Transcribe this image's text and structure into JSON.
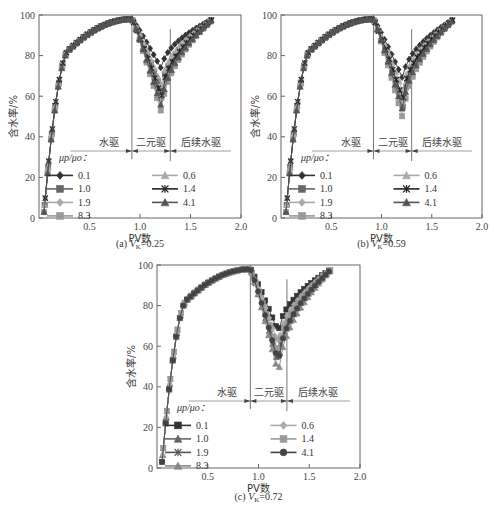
{
  "chart_data": [
    {
      "id": "a",
      "type": "line",
      "caption": "(a) V",
      "caption_sub": "K",
      "caption_val": "=0.25",
      "xlabel": "PV数",
      "ylabel": "含水率/%",
      "xlim": [
        0,
        2.0
      ],
      "ylim": [
        0,
        100
      ],
      "xticks": [
        "0.5",
        "1.0",
        "1.5",
        "2.0"
      ],
      "yticks": [
        "0",
        "20",
        "40",
        "60",
        "80",
        "100"
      ],
      "regions": [
        {
          "label": "水驱"
        },
        {
          "label": "二元驱"
        },
        {
          "label": "后续水驱"
        }
      ],
      "boundaries": [
        0.92,
        1.3
      ],
      "legend_title": "μp/μo：",
      "series": [
        {
          "name": "0.1",
          "marker": "diamond",
          "color": "#333333",
          "min": 73
        },
        {
          "name": "1.0",
          "marker": "square",
          "color": "#666666",
          "min": 62
        },
        {
          "name": "1.9",
          "marker": "diamond",
          "color": "#aaaaaa",
          "min": 57
        },
        {
          "name": "8.3",
          "marker": "square",
          "color": "#999999",
          "min": 51
        },
        {
          "name": "0.6",
          "marker": "triangle",
          "color": "#aaaaaa",
          "min": 65
        },
        {
          "name": "1.4",
          "marker": "star",
          "color": "#222222",
          "min": 59
        },
        {
          "name": "4.1",
          "marker": "triangle",
          "color": "#555555",
          "min": 54
        }
      ]
    },
    {
      "id": "b",
      "type": "line",
      "caption": "(b) V",
      "caption_sub": "K",
      "caption_val": "=0.59",
      "xlabel": "PV数",
      "ylabel": "含水率/%",
      "xlim": [
        0,
        2.0
      ],
      "ylim": [
        0,
        100
      ],
      "xticks": [
        "0.5",
        "1.0",
        "1.5",
        "2.0"
      ],
      "yticks": [
        "0",
        "20",
        "40",
        "60",
        "80",
        "100"
      ],
      "regions": [
        {
          "label": "水驱"
        },
        {
          "label": "二元驱"
        },
        {
          "label": "后续水驱"
        }
      ],
      "boundaries": [
        0.92,
        1.3
      ],
      "legend_title": "μp/μo：",
      "series": [
        {
          "name": "0.1",
          "marker": "diamond",
          "color": "#333333",
          "min": 68
        },
        {
          "name": "1.0",
          "marker": "square",
          "color": "#666666",
          "min": 54
        },
        {
          "name": "1.9",
          "marker": "diamond",
          "color": "#aaaaaa",
          "min": 56
        },
        {
          "name": "8.3",
          "marker": "square",
          "color": "#999999",
          "min": 48
        },
        {
          "name": "0.6",
          "marker": "triangle",
          "color": "#aaaaaa",
          "min": 62
        },
        {
          "name": "1.4",
          "marker": "star",
          "color": "#222222",
          "min": 58
        },
        {
          "name": "4.1",
          "marker": "triangle",
          "color": "#555555",
          "min": 52
        }
      ]
    },
    {
      "id": "c",
      "type": "line",
      "caption": "(c) V",
      "caption_sub": "K",
      "caption_val": "=0.72",
      "xlabel": "PV数",
      "ylabel": "含水率/%",
      "xlim": [
        0,
        2.0
      ],
      "ylim": [
        0,
        100
      ],
      "xticks": [
        "0.5",
        "1.0",
        "1.5",
        "2.0"
      ],
      "yticks": [
        "0",
        "20",
        "40",
        "60",
        "80",
        "100"
      ],
      "regions": [
        {
          "label": "水驱"
        },
        {
          "label": "二元驱"
        },
        {
          "label": "后续水驱"
        }
      ],
      "boundaries": [
        0.92,
        1.28
      ],
      "legend_title": "μp/μo：",
      "series": [
        {
          "name": "0.1",
          "marker": "square",
          "color": "#333333",
          "min": 66
        },
        {
          "name": "1.0",
          "marker": "triangle",
          "color": "#666666",
          "min": 50
        },
        {
          "name": "1.9",
          "marker": "star",
          "color": "#555555",
          "min": 53
        },
        {
          "name": "8.3",
          "marker": "triangle",
          "color": "#888888",
          "min": 45
        },
        {
          "name": "0.6",
          "marker": "diamond",
          "color": "#aaaaaa",
          "min": 60
        },
        {
          "name": "1.4",
          "marker": "square",
          "color": "#999999",
          "min": 56
        },
        {
          "name": "4.1",
          "marker": "circle",
          "color": "#444444",
          "min": 51
        }
      ]
    }
  ]
}
